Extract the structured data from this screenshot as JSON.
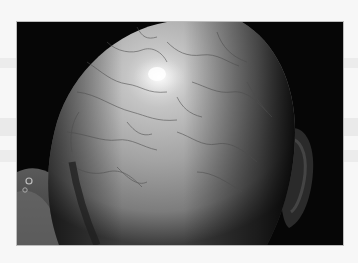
{
  "image": {
    "description": "Grayscale clinical photograph of the top/back of a bald human scalp showing a network of fine dark vessel-like lines, a bright specular highlight near the crown, a dark background, and part of an ear on the right",
    "subject": "bald scalp",
    "palette": {
      "background_page": "#f7f7f7",
      "margin_bands": "#e4e4e4",
      "photo_background": "#060606",
      "scalp_mid": "#9a9a9a",
      "scalp_highlight": "#f0f0f0",
      "scalp_shadow": "#3a3a3a"
    },
    "frame": {
      "x": 17,
      "y": 22,
      "width": 326,
      "height": 223
    }
  }
}
